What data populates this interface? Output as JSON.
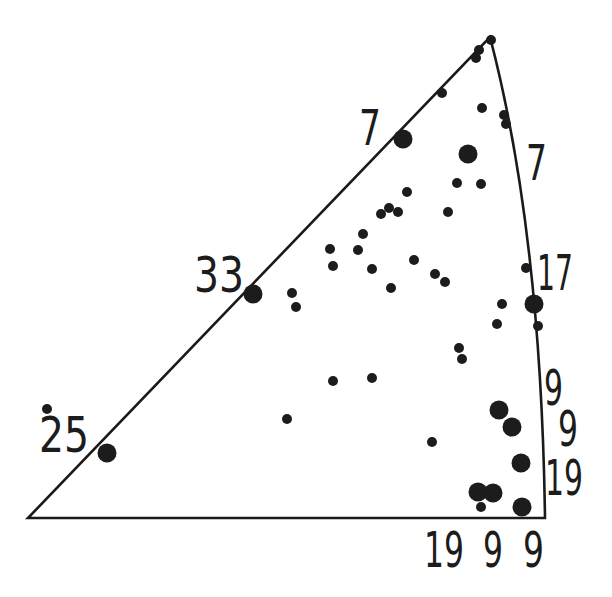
{
  "figure": {
    "type": "stereographic-triangle-scatter",
    "vertices": {
      "bottom_left": [
        28,
        518
      ],
      "bottom_right": [
        545,
        518
      ],
      "top": [
        490,
        37
      ]
    },
    "right_edge_control": [
      541,
      232
    ],
    "colors": {
      "ink": "#1c1c1c",
      "background": "#ffffff"
    }
  },
  "labels": [
    {
      "id": "label-left-edge-7",
      "text": "7",
      "x": 359,
      "y": 145,
      "w": 22
    },
    {
      "id": "label-right-edge-7",
      "text": "7",
      "x": 526,
      "y": 180,
      "w": 21
    },
    {
      "id": "label-left-edge-33",
      "text": "33",
      "x": 194,
      "y": 292,
      "w": 50
    },
    {
      "id": "label-right-edge-17",
      "text": "17",
      "x": 537,
      "y": 290,
      "w": 36
    },
    {
      "id": "label-left-edge-25",
      "text": "25",
      "x": 39,
      "y": 452,
      "w": 50
    },
    {
      "id": "label-right-edge-9a",
      "text": "9",
      "x": 544,
      "y": 405,
      "w": 19
    },
    {
      "id": "label-right-edge-9b",
      "text": "9",
      "x": 558,
      "y": 446,
      "w": 20
    },
    {
      "id": "label-right-edge-19",
      "text": "19",
      "x": 545,
      "y": 495,
      "w": 38
    },
    {
      "id": "label-bottom-19",
      "text": "19",
      "x": 424,
      "y": 567,
      "w": 40
    },
    {
      "id": "label-bottom-9a",
      "text": "9",
      "x": 483,
      "y": 567,
      "w": 20
    },
    {
      "id": "label-bottom-9b",
      "text": "9",
      "x": 523,
      "y": 567,
      "w": 21
    }
  ],
  "points": {
    "small_radius": 5,
    "large_radius": 9.5,
    "small": [
      [
        491,
        40
      ],
      [
        479,
        50
      ],
      [
        476,
        58
      ],
      [
        442,
        93
      ],
      [
        482,
        108
      ],
      [
        504,
        115
      ],
      [
        506,
        124
      ],
      [
        457,
        183
      ],
      [
        481,
        184
      ],
      [
        407,
        192
      ],
      [
        448,
        212
      ],
      [
        381,
        214
      ],
      [
        389,
        208
      ],
      [
        398,
        212
      ],
      [
        363,
        234
      ],
      [
        330,
        249
      ],
      [
        358,
        250
      ],
      [
        333,
        266
      ],
      [
        372,
        269
      ],
      [
        414,
        260
      ],
      [
        435,
        274
      ],
      [
        445,
        282
      ],
      [
        391,
        288
      ],
      [
        292,
        293
      ],
      [
        296,
        307
      ],
      [
        526,
        268
      ],
      [
        502,
        304
      ],
      [
        497,
        324
      ],
      [
        538,
        326
      ],
      [
        459,
        348
      ],
      [
        462,
        359
      ],
      [
        333,
        381
      ],
      [
        372,
        378
      ],
      [
        287,
        419
      ],
      [
        432,
        442
      ],
      [
        481,
        507
      ],
      [
        47,
        409
      ]
    ],
    "large": [
      [
        403,
        139
      ],
      [
        468,
        154
      ],
      [
        253,
        294
      ],
      [
        107,
        453
      ],
      [
        534,
        304
      ],
      [
        499,
        410
      ],
      [
        512,
        427
      ],
      [
        521,
        463
      ],
      [
        478,
        492
      ],
      [
        493,
        493
      ],
      [
        522,
        507
      ]
    ]
  }
}
